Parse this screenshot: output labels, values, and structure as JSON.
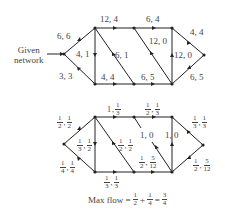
{
  "given_label": [
    "Given",
    "network"
  ],
  "top_graph": {
    "edges": [
      {
        "id": "s-a",
        "label": "6, 6"
      },
      {
        "id": "s-b",
        "label": "3, 3"
      },
      {
        "id": "a-b",
        "label": "4, 1"
      },
      {
        "id": "a-c",
        "label": "12, 4"
      },
      {
        "id": "a-d",
        "label": "6, 1"
      },
      {
        "id": "b-d",
        "label": "4, 4"
      },
      {
        "id": "c-e",
        "label": "6, 4"
      },
      {
        "id": "c-f",
        "label": "12, 0"
      },
      {
        "id": "d-f",
        "label": "6, 5"
      },
      {
        "id": "f-e",
        "label": "12, 0"
      },
      {
        "id": "e-t",
        "label": "4, 4"
      },
      {
        "id": "f-t",
        "label": "6, 5"
      }
    ]
  },
  "bottom_graph": {
    "edges": [
      {
        "id": "s-a",
        "cap": {
          "n": "1",
          "d": "2"
        },
        "flow": {
          "n": "1",
          "d": "2"
        }
      },
      {
        "id": "s-b",
        "cap": {
          "n": "1",
          "d": "4"
        },
        "flow": {
          "n": "1",
          "d": "4"
        }
      },
      {
        "id": "a-b",
        "cap": {
          "n": "1",
          "d": "3"
        },
        "flow": {
          "n": "1",
          "d": "2"
        }
      },
      {
        "id": "a-c",
        "cap": "1",
        "flow": {
          "n": "1",
          "d": "3"
        }
      },
      {
        "id": "a-d",
        "cap": {
          "n": "1",
          "d": "2"
        },
        "flow": {
          "n": "1",
          "d": "2"
        }
      },
      {
        "id": "b-d",
        "cap": {
          "n": "1",
          "d": "3"
        },
        "flow": {
          "n": "1",
          "d": "3"
        }
      },
      {
        "id": "c-e",
        "cap": {
          "n": "1",
          "d": "2"
        },
        "flow": {
          "n": "1",
          "d": "3"
        }
      },
      {
        "id": "c-f",
        "label": "1, 0"
      },
      {
        "id": "d-f",
        "cap": {
          "n": "1",
          "d": "2"
        },
        "flow": {
          "n": "5",
          "d": "12"
        }
      },
      {
        "id": "f-e",
        "label": "1, 0"
      },
      {
        "id": "e-t",
        "cap": {
          "n": "1",
          "d": "3"
        },
        "flow": {
          "n": "1",
          "d": "3"
        }
      },
      {
        "id": "f-t",
        "cap": {
          "n": "1",
          "d": "2"
        },
        "flow": {
          "n": "5",
          "d": "12"
        }
      }
    ]
  },
  "max_flow": {
    "prefix": "Max flow =",
    "terms": [
      {
        "n": "1",
        "d": "2"
      },
      {
        "n": "1",
        "d": "4"
      }
    ],
    "plus": "+",
    "equals": "=",
    "result": {
      "n": "3",
      "d": "4"
    }
  }
}
